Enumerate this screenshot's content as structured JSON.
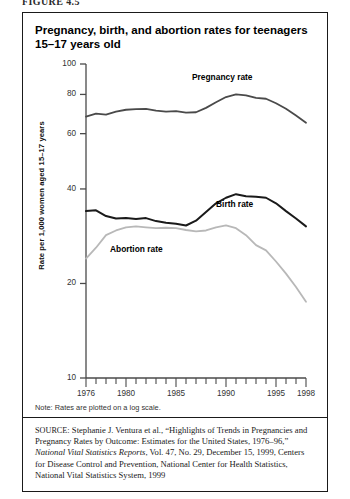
{
  "figure_label": "FIGURE 4.5",
  "chart_title": "Pregnancy, birth, and abortion rates for teenagers 15–17 years old",
  "note": "Note: Rates are plotted on a log scale.",
  "source": {
    "prefix": "SOURCE",
    "text_a": ": Stephanie J. Ventura et al., “Highlights of Trends in Pregnancies and Pregnancy Rates by Outcome: Estimates for the United States, 1976–96,” ",
    "italic": "National Vital Statistics Reports",
    "text_b": ", Vol. 47, No. 29, December 15, 1999, Centers for Disease Control and Prevention, National Center for Health Statistics, National Vital Statistics System, 1999"
  },
  "chart_data": {
    "type": "line",
    "title": "Pregnancy, birth, and abortion rates for teenagers 15–17 years old",
    "xlabel": "",
    "ylabel": "Rate per 1,000 women aged 15–17 years",
    "yscale": "log",
    "ylim": [
      10,
      100
    ],
    "xlim": [
      1976,
      1998
    ],
    "ytick_values": [
      10,
      20,
      40,
      60,
      80,
      100
    ],
    "ytick_labels": [
      "10",
      "20",
      "40",
      "60",
      "80",
      "100"
    ],
    "xtick_values": [
      1976,
      1977,
      1978,
      1979,
      1980,
      1981,
      1982,
      1983,
      1984,
      1985,
      1986,
      1987,
      1988,
      1989,
      1990,
      1991,
      1992,
      1993,
      1994,
      1995,
      1996,
      1997,
      1998
    ],
    "xtick_labeled": [
      1976,
      1980,
      1985,
      1990,
      1995,
      1998
    ],
    "grid": false,
    "legend": "inline-annotations",
    "x": [
      1976,
      1977,
      1978,
      1979,
      1980,
      1981,
      1982,
      1983,
      1984,
      1985,
      1986,
      1987,
      1988,
      1989,
      1990,
      1991,
      1992,
      1993,
      1994,
      1995,
      1996,
      1997,
      1998
    ],
    "series": [
      {
        "name": "Pregnancy rate",
        "color": "#4a4a4a",
        "width": 1.8,
        "label_x": 1989.2,
        "label_y": 90,
        "values": [
          68.0,
          69.5,
          69.0,
          70.5,
          71.5,
          71.8,
          72.0,
          71.0,
          70.5,
          70.8,
          70.0,
          70.2,
          72.5,
          75.5,
          78.5,
          80.0,
          79.5,
          78.0,
          77.5,
          75.0,
          72.0,
          68.5,
          65.0
        ]
      },
      {
        "name": "Birth rate",
        "color": "#1a1a1a",
        "width": 2.0,
        "label_x": 1991.6,
        "label_y": 35.5,
        "values": [
          34.0,
          34.2,
          32.8,
          32.2,
          32.3,
          32.1,
          32.3,
          31.6,
          31.2,
          31.0,
          30.6,
          31.7,
          33.8,
          36.0,
          37.5,
          38.5,
          37.9,
          37.8,
          37.5,
          36.0,
          34.0,
          32.2,
          30.4
        ]
      },
      {
        "name": "Abortion rate",
        "color": "#b8b8b8",
        "width": 1.8,
        "label_x": 1981.0,
        "label_y": 25.5,
        "values": [
          24.0,
          26.0,
          28.5,
          29.5,
          30.2,
          30.4,
          30.2,
          30.0,
          30.1,
          30.0,
          29.6,
          29.3,
          29.5,
          30.2,
          30.6,
          30.0,
          28.5,
          26.5,
          25.5,
          23.5,
          21.5,
          19.5,
          17.5
        ]
      }
    ]
  }
}
